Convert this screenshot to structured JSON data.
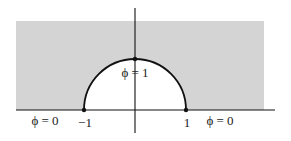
{
  "figure": {
    "type": "semicircular boundary-value diagram",
    "colors": {
      "shaded_region": "#d4d4d4",
      "interior": "#ffffff",
      "lines": "#111111"
    },
    "geometry": {
      "shaded_rect": {
        "x": 16,
        "y": 21,
        "width": 248,
        "height": 89
      },
      "x_axis": {
        "x1": 16,
        "x2": 275,
        "y": 110
      },
      "y_axis": {
        "x": 135,
        "y1": 8,
        "y2": 133
      },
      "semicircle": {
        "cx": 135,
        "cy": 110,
        "r": 51
      },
      "points": [
        {
          "name": "minus-one",
          "x": 84,
          "y": 110
        },
        {
          "name": "one",
          "x": 186,
          "y": 110
        },
        {
          "name": "top",
          "x": 135,
          "y": 59
        }
      ]
    },
    "labels": {
      "phi_left": "ϕ = 0",
      "phi_right": "ϕ = 0",
      "phi_top": "ϕ = 1",
      "tick_minus_one": "−1",
      "tick_one": "1"
    }
  }
}
